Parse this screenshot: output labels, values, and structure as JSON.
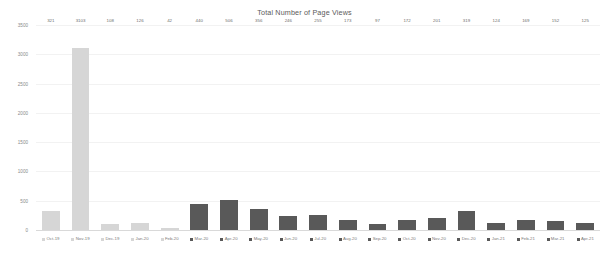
{
  "chart_data": {
    "type": "bar",
    "title": "Total Number of Page Views",
    "xlabel": "",
    "ylabel": "",
    "ylim": [
      0,
      3500
    ],
    "yticks": [
      3500,
      3000,
      2500,
      2000,
      1500,
      1000,
      500,
      0
    ],
    "ytick_labels": [
      "3500",
      "3000",
      "2500",
      "2000",
      "1500",
      "1000",
      "500",
      "0"
    ],
    "grid": true,
    "legend": "none",
    "categories": [
      "Oct-19",
      "Nov-19",
      "Dec-19",
      "Jan-20",
      "Feb-20",
      "Mar-20",
      "Apr-20",
      "May-20",
      "Jun-20",
      "Jul-20",
      "Aug-20",
      "Sep-20",
      "Oct-20",
      "Nov-20",
      "Dec-20",
      "Jan-21",
      "Feb-21",
      "Mar-21",
      "Apr-21"
    ],
    "values": [
      321,
      3103,
      108,
      126,
      42,
      440,
      506,
      356,
      246,
      255,
      173,
      97,
      172,
      201,
      319,
      124,
      169,
      152,
      125
    ],
    "value_labels": [
      "321",
      "3103",
      "108",
      "126",
      "42",
      "440",
      "506",
      "356",
      "246",
      "255",
      "173",
      "97",
      "172",
      "201",
      "319",
      "124",
      "169",
      "152",
      "125"
    ],
    "bar_colors": [
      "#d6d6d6",
      "#d6d6d6",
      "#d6d6d6",
      "#d6d6d6",
      "#d6d6d6",
      "#595959",
      "#595959",
      "#595959",
      "#595959",
      "#595959",
      "#595959",
      "#595959",
      "#595959",
      "#595959",
      "#595959",
      "#595959",
      "#595959",
      "#595959",
      "#595959"
    ],
    "colors": {
      "light_series": "#d6d6d6",
      "dark_series": "#595959",
      "title_text": "#5a5a5a",
      "axis_text": "#8a8a8a",
      "gridline": "#f2f2f2",
      "background": "#ffffff"
    }
  }
}
